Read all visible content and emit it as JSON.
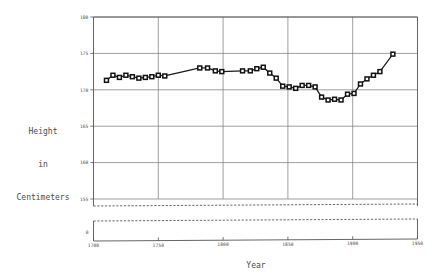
{
  "chart_data": {
    "type": "line",
    "title": "",
    "xlabel": "Year",
    "ylabel_lines": [
      "Height",
      "in",
      "Centimeters"
    ],
    "ylabel": "Height in Centimeters",
    "xlim": [
      1700,
      1950
    ],
    "ylim": [
      155,
      180
    ],
    "ytick_labels": [
      "180",
      "175",
      "170",
      "165",
      "160",
      "155"
    ],
    "ytick_values": [
      180,
      175,
      170,
      165,
      160,
      155
    ],
    "xtick_labels": [
      "1700",
      "1750",
      "1800",
      "1850",
      "1900",
      "1950"
    ],
    "xtick_values": [
      1700,
      1750,
      1800,
      1850,
      1900,
      1950
    ],
    "axis_break": {
      "label": "0",
      "present": true,
      "style": "dashed-double-line"
    },
    "grid": "horizontal-and-vertical",
    "legend": "none",
    "marker": "open-square",
    "series": [
      {
        "name": "Height",
        "x": [
          1710,
          1715,
          1720,
          1725,
          1730,
          1735,
          1740,
          1745,
          1750,
          1755,
          1782,
          1788,
          1794,
          1799,
          1815,
          1821,
          1826,
          1831,
          1836,
          1841,
          1846,
          1851,
          1856,
          1861,
          1866,
          1871,
          1876,
          1881,
          1886,
          1891,
          1896,
          1901,
          1906,
          1911,
          1916,
          1921,
          1931
        ],
        "y": [
          171.3,
          172.0,
          171.7,
          172.0,
          171.8,
          171.6,
          171.7,
          171.8,
          172.0,
          171.9,
          173.0,
          173.0,
          172.6,
          172.5,
          172.6,
          172.6,
          172.9,
          173.1,
          172.3,
          171.6,
          170.5,
          170.4,
          170.2,
          170.6,
          170.6,
          170.4,
          169.0,
          168.6,
          168.7,
          168.6,
          169.4,
          169.5,
          170.8,
          171.5,
          172.0,
          172.5,
          174.9
        ]
      }
    ],
    "colors": {
      "line": "#1c1c1c",
      "marker_fill": "#ffffff",
      "marker_stroke": "#111111",
      "grid": "#777777",
      "axis": "#555555",
      "text": "#4a4a4a",
      "background": "#ffffff"
    }
  },
  "figure": {
    "x_axis_title": "Year",
    "y_axis_title_line1": "Height",
    "y_axis_title_line2": "in",
    "y_axis_title_line3": "Centimeters",
    "break_zero_label": "0"
  }
}
